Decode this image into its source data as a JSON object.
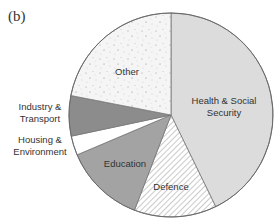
{
  "panel_label": "(b)",
  "chart_data": {
    "type": "pie",
    "title": "",
    "note": "Values are approximate shares estimated from slice angles; no percentages are shown in the figure.",
    "categories": [
      "Health & Social Security",
      "Defence",
      "Education",
      "Housing & Environment",
      "Industry & Transport",
      "Other"
    ],
    "values": [
      42.8,
      13.0,
      12.8,
      3.0,
      6.4,
      22.0
    ],
    "slices": [
      {
        "label": "Health & Social Security",
        "lines": [
          "Health & Social",
          "Security"
        ],
        "start": 0,
        "end": 154,
        "fill": "#dcdcdc",
        "pattern": "solid",
        "label_pos": "inside"
      },
      {
        "label": "Defence",
        "lines": [
          "Defence"
        ],
        "start": 154,
        "end": 201,
        "fill": "#ffffff",
        "pattern": "hatch",
        "label_pos": "inside"
      },
      {
        "label": "Education",
        "lines": [
          "Education"
        ],
        "start": 201,
        "end": 247,
        "fill": "#a3a3a3",
        "pattern": "solid",
        "label_pos": "inside"
      },
      {
        "label": "Housing & Environment",
        "lines": [
          "Housing &",
          "Environment"
        ],
        "start": 247,
        "end": 258,
        "fill": "#ffffff",
        "pattern": "solid",
        "label_pos": "outside"
      },
      {
        "label": "Industry & Transport",
        "lines": [
          "Industry &",
          "Transport"
        ],
        "start": 258,
        "end": 281,
        "fill": "#8c8c8c",
        "pattern": "solid",
        "label_pos": "outside"
      },
      {
        "label": "Other",
        "lines": [
          "Other"
        ],
        "start": 281,
        "end": 360,
        "fill": "#f4f4f4",
        "pattern": "speckle",
        "label_pos": "inside"
      }
    ],
    "legend": "none",
    "direction": "clockwise from 12 o'clock"
  },
  "labels": {
    "health": [
      "Health & Social",
      "Security"
    ],
    "defence": "Defence",
    "education": "Education",
    "housing": [
      "Housing &",
      "Environment"
    ],
    "industry": [
      "Industry &",
      "Transport"
    ],
    "other": "Other"
  }
}
